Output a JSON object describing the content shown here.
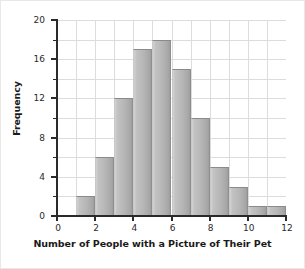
{
  "chart_data": {
    "type": "bar",
    "title": "",
    "xlabel": "Number of People with a Picture of Their Pet",
    "ylabel": "Frequency",
    "grid": true,
    "legend": false,
    "xlim": [
      0,
      12
    ],
    "ylim": [
      0,
      20
    ],
    "x_major_ticks": [
      0,
      2,
      4,
      6,
      8,
      10,
      12
    ],
    "x_tick_labels": [
      "0",
      "2",
      "4",
      "6",
      "8",
      "10",
      "12"
    ],
    "y_major_ticks": [
      0,
      4,
      8,
      12,
      16,
      20
    ],
    "y_tick_labels": [
      "0",
      "4",
      "8",
      "12",
      "16",
      "20"
    ],
    "y_minor_ticks": [
      2,
      6,
      10,
      14,
      18
    ],
    "bin_width": 1,
    "bin_starts": [
      1,
      2,
      3,
      4,
      5,
      6,
      7,
      8,
      9,
      10,
      11
    ],
    "bin_ends": [
      2,
      3,
      4,
      5,
      6,
      7,
      8,
      9,
      10,
      11,
      12
    ],
    "categories": [
      "1-2",
      "2-3",
      "3-4",
      "4-5",
      "5-6",
      "6-7",
      "7-8",
      "8-9",
      "9-10",
      "10-11",
      "11-12"
    ],
    "values": [
      2,
      6,
      12,
      17,
      18,
      15,
      10,
      5,
      3,
      1,
      1
    ],
    "bar_fill_light": "#d2d2d2",
    "bar_fill_dark": "#9e9e9e",
    "bar_edge": "#8a8a8a",
    "grid_color": "#dcdcdc",
    "axis_color": "#2a2a2a"
  }
}
